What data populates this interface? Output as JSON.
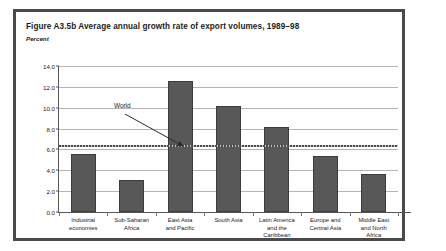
{
  "figure": {
    "title": "Figure A3.5b  Average annual growth rate of export volumes, 1989–98",
    "subtitle": "Percent"
  },
  "annotation": {
    "world_label": "World"
  },
  "chart_data": {
    "type": "bar",
    "title": "Figure A3.5b  Average annual growth rate of export volumes, 1989–98",
    "subtitle": "Percent",
    "xlabel": "",
    "ylabel": "Percent",
    "ylim": [
      0.0,
      14.0
    ],
    "ytick_step": 2.0,
    "ytick_labels": [
      "0.0",
      "2.0",
      "4.0",
      "6.0",
      "8.0",
      "10.0",
      "12.0",
      "14.0"
    ],
    "ytick_values": [
      0.0,
      2.0,
      4.0,
      6.0,
      8.0,
      10.0,
      12.0,
      14.0
    ],
    "grid": true,
    "legend": "none",
    "bar_color": "#585858",
    "categories": [
      "Industrial economies",
      "Sub-Saharan Africa",
      "East Asia and Pacific",
      "South Asia",
      "Latin America and the Caribbean",
      "Europe and Central Asia",
      "Middle East and North Africa"
    ],
    "category_lines": [
      [
        "Industrial",
        "economies"
      ],
      [
        "Sub-Saharan",
        "Africa"
      ],
      [
        "East Asia",
        "and Pacific"
      ],
      [
        "South Asia"
      ],
      [
        "Latin America",
        "and the",
        "Caribbean"
      ],
      [
        "Europe and",
        "Central Asia"
      ],
      [
        "Middle East",
        "and North",
        "Africa"
      ]
    ],
    "values": [
      5.6,
      3.1,
      12.6,
      10.2,
      8.2,
      5.4,
      3.6
    ],
    "reference_line": {
      "label": "World",
      "value": 6.3,
      "style": "dotted"
    }
  }
}
